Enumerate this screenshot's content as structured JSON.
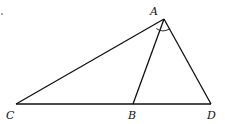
{
  "diagram": {
    "type": "triangle",
    "points": {
      "A": {
        "label": "A",
        "x": 164,
        "y": 19
      },
      "B": {
        "label": "B",
        "x": 133,
        "y": 104
      },
      "C": {
        "label": "C",
        "x": 16,
        "y": 104
      },
      "D": {
        "label": "D",
        "x": 211,
        "y": 104
      }
    },
    "segments": [
      "AC",
      "AB",
      "AD",
      "CD"
    ],
    "angle_marks": [
      {
        "vertex": "A",
        "between": [
          "B",
          "D"
        ]
      }
    ],
    "line_color": "#111111"
  }
}
